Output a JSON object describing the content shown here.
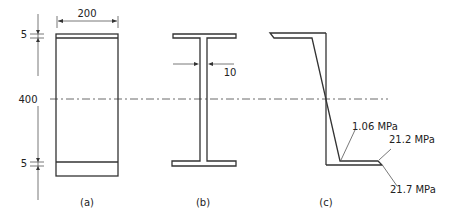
{
  "diagram": {
    "type": "beam-cross-section-stress-distribution",
    "panels": [
      {
        "id": "a",
        "label": "(a)",
        "description": "Rectangular section with flanges"
      },
      {
        "id": "b",
        "label": "(b)",
        "description": "Equivalent I-section"
      },
      {
        "id": "c",
        "label": "(c)",
        "description": "Bending stress distribution"
      }
    ],
    "dimensions": {
      "width": "200",
      "depth": "400",
      "flange_top": "5",
      "flange_bottom": "5",
      "web_thickness": "10"
    },
    "stresses": {
      "s1": "1.06 MPa",
      "s2": "21.2 MPa",
      "s3": "21.7 MPa"
    }
  }
}
